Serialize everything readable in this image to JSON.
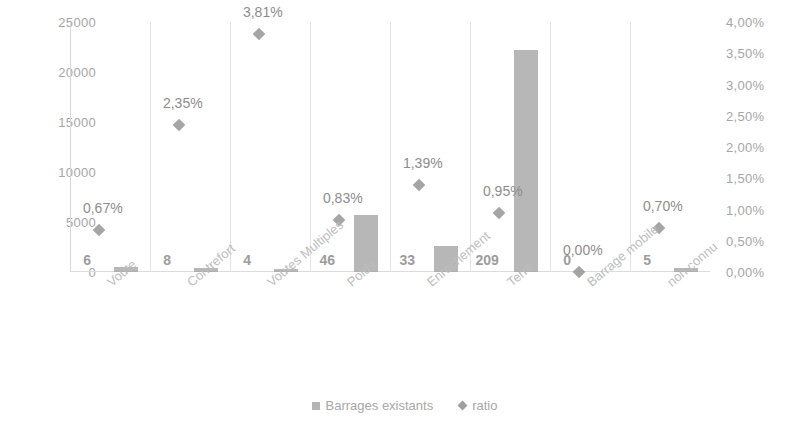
{
  "chart_data": {
    "type": "bar",
    "title": "",
    "xlabel": "",
    "ylabel": "",
    "categories": [
      "Voute",
      "Contrefort",
      "Voutes Multiples",
      "Poids",
      "Enrochement",
      "Terre",
      "Barrage mobile",
      "non connu"
    ],
    "series": [
      {
        "name": "Barrages existants",
        "marker": "square",
        "axis": "left",
        "values": [
          6,
          8,
          4,
          46,
          33,
          209,
          0,
          5
        ],
        "value_labels": [
          "6",
          "8",
          "4",
          "46",
          "33",
          "209",
          "0",
          "5"
        ],
        "bar_pixel_heights": [
          500,
          400,
          300,
          5700,
          2600,
          22200,
          0,
          400
        ]
      },
      {
        "name": "ratio",
        "marker": "diamond",
        "axis": "right",
        "values": [
          0.67,
          2.35,
          3.81,
          0.83,
          1.39,
          0.95,
          0.0,
          0.7
        ],
        "value_labels": [
          "0,67%",
          "2,35%",
          "3,81%",
          "0,83%",
          "1,39%",
          "0,95%",
          "0,00%",
          "0,70%"
        ]
      }
    ],
    "left_axis": {
      "ticks": [
        "0",
        "5000",
        "10000",
        "15000",
        "20000",
        "25000"
      ],
      "tick_values": [
        0,
        5000,
        10000,
        15000,
        20000,
        25000
      ],
      "ylim": [
        0,
        25000
      ]
    },
    "right_axis": {
      "ticks": [
        "0,00%",
        "0,50%",
        "1,00%",
        "1,50%",
        "2,00%",
        "2,50%",
        "3,00%",
        "3,50%",
        "4,00%"
      ],
      "tick_values": [
        0,
        0.5,
        1.0,
        1.5,
        2.0,
        2.5,
        3.0,
        3.5,
        4.0
      ],
      "ylim": [
        0,
        4.0
      ]
    },
    "grid": false,
    "legend_position": "bottom",
    "legend": [
      "Barrages existants",
      "ratio"
    ],
    "colors": {
      "bar": "#a3a3a3",
      "marker": "#8e8e8e",
      "text": "#9a9a9a",
      "separator": "#e2e2e2"
    }
  }
}
